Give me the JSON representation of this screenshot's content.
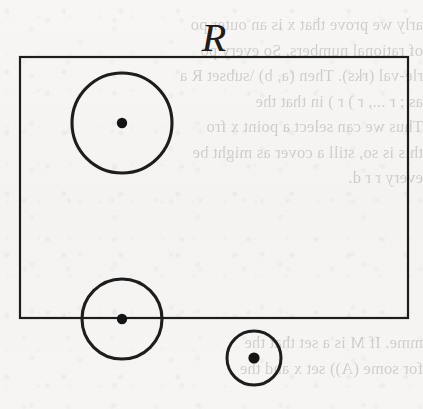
{
  "figure": {
    "label": "R",
    "label_x": 214,
    "label_y": 18,
    "label_font_size": 40,
    "canvas": {
      "width": 423,
      "height": 409
    },
    "background_color": "#f6f5f3",
    "ink_color": "#1d1d1d",
    "rectangle": {
      "name": "region-R",
      "x": 20,
      "y": 57,
      "width": 388,
      "height": 261,
      "stroke_width": 2.2,
      "fill": "none"
    },
    "circles": [
      {
        "name": "large-circle-interior",
        "cx": 122,
        "cy": 123,
        "r": 50,
        "stroke_width": 3.1,
        "dot_r": 5.2,
        "position": "fully inside R"
      },
      {
        "name": "medium-circle-boundary",
        "cx": 122,
        "cy": 319,
        "r": 40,
        "stroke_width": 3.1,
        "dot_r": 5.2,
        "position": "centered on bottom edge of R"
      },
      {
        "name": "small-circle-exterior",
        "cx": 254,
        "cy": 358,
        "r": 27,
        "stroke_width": 3.0,
        "dot_r": 5.6,
        "position": "fully outside R"
      }
    ]
  },
  "bleed_through": {
    "description": "faint mirrored text showing through from the reverse side of the scanned page",
    "top_block": [
      "arly we prove that x is an outer po",
      "of rational numbers. So every po",
      "rle-val (rks). Then (a, b) \\subset R a",
      "as  ;  r  ..., r  )  r  ) in that the",
      "Thus we can select a point x  fro",
      "this is so, still a cover as might be",
      "every r  r  d."
    ],
    "middle_block": [
      "",
      ""
    ],
    "bottom_block": [
      "mme. If  M  is  a  set  that  the",
      "for  some  (A))  set x  and the"
    ]
  }
}
